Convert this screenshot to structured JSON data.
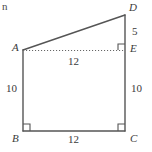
{
  "figure": {
    "width": 152,
    "height": 152,
    "background_color": "#ffffff",
    "stroke_color": "#555555",
    "text_color": "#3a3a3a",
    "corner_fragment_text": "n",
    "vertices": [
      {
        "name": "A",
        "label": "A",
        "x": 23,
        "y": 50
      },
      {
        "name": "B",
        "label": "B",
        "x": 23,
        "y": 131
      },
      {
        "name": "C",
        "label": "C",
        "x": 125,
        "y": 131
      },
      {
        "name": "D",
        "label": "D",
        "x": 125,
        "y": 15
      },
      {
        "name": "E",
        "label": "E",
        "x": 125,
        "y": 50
      }
    ],
    "edges": [
      {
        "name": "AD",
        "from": "A",
        "to": "D",
        "style": "solid"
      },
      {
        "name": "AB",
        "from": "A",
        "to": "B",
        "style": "solid"
      },
      {
        "name": "BC",
        "from": "B",
        "to": "C",
        "style": "solid"
      },
      {
        "name": "CD",
        "from": "C",
        "to": "D",
        "style": "solid"
      },
      {
        "name": "AE",
        "from": "A",
        "to": "E",
        "style": "dotted"
      }
    ],
    "measurements": [
      {
        "name": "AB",
        "value": "10",
        "x": 7,
        "y": 85
      },
      {
        "name": "BC",
        "value": "12",
        "x": 68,
        "y": 135
      },
      {
        "name": "AE",
        "value": "12",
        "x": 68,
        "y": 57
      },
      {
        "name": "EC",
        "value": "10",
        "x": 131,
        "y": 85
      },
      {
        "name": "DE",
        "value": "5",
        "x": 131,
        "y": 27
      }
    ],
    "vertex_label_positions": [
      {
        "name": "A",
        "x": 12,
        "y": 42
      },
      {
        "name": "B",
        "x": 12,
        "y": 134
      },
      {
        "name": "C",
        "x": 130,
        "y": 134
      },
      {
        "name": "D",
        "x": 130,
        "y": 3
      },
      {
        "name": "E",
        "x": 130,
        "y": 43
      }
    ],
    "right_angle_marks": [
      {
        "name": "angle-at-B",
        "x": 23,
        "y": 131,
        "dx": 1,
        "dy": -1
      },
      {
        "name": "angle-at-C",
        "x": 125,
        "y": 131,
        "dx": -1,
        "dy": -1
      },
      {
        "name": "angle-at-E",
        "x": 125,
        "y": 50,
        "dx": -1,
        "dy": -1
      }
    ]
  }
}
